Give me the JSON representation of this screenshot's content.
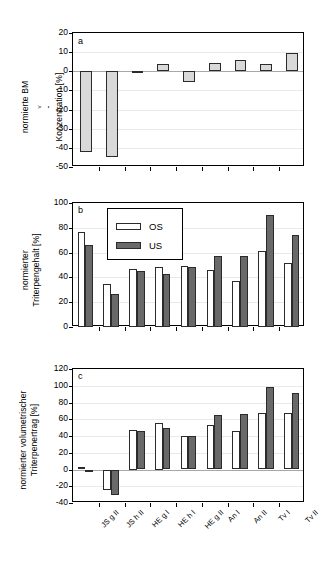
{
  "figure": {
    "categories": [
      "JS g II",
      "JS h II",
      "HE g I",
      "HE h I",
      "HE g II",
      "An I",
      "An II",
      "Tv I",
      "Tv II"
    ],
    "legend": {
      "os_label": "OS",
      "us_label": "US"
    },
    "colors": {
      "os": "#ffffff",
      "us": "#696969",
      "single": "#d9d9d9",
      "axis": "#000000",
      "grid": "#e9e9e9",
      "zero": "#a8a8a8"
    }
  },
  "chart_data": [
    {
      "type": "bar",
      "panel": "a",
      "panel_label": "a",
      "title": "",
      "xlabel": "",
      "ylabel": "normierte BMv-Konzentration [%]",
      "ylabel_line1": "normierte BM",
      "ylabel_sub": "v",
      "ylabel_line1_tail": "-",
      "ylabel_line2": "Konzentration [%]",
      "categories": [
        "JS g II",
        "JS h II",
        "HE g I",
        "HE h I",
        "HE g II",
        "An I",
        "An II",
        "Tv I",
        "Tv II"
      ],
      "values": [
        -42,
        -45,
        -0.3,
        4,
        -5.5,
        4.5,
        6,
        4,
        9.5
      ],
      "ylim": [
        -50,
        20
      ],
      "yticks": [
        20,
        10,
        0,
        -10,
        -20,
        -30,
        -40,
        -50
      ],
      "grid": true,
      "legend_position": "none"
    },
    {
      "type": "bar",
      "panel": "b",
      "panel_label": "b",
      "title": "",
      "xlabel": "",
      "ylabel": "normierter Triterpengehalt [%]",
      "ylabel_line1": "normierter",
      "ylabel_line2": "Triterpengehalt [%]",
      "categories": [
        "JS g II",
        "JS h II",
        "HE g I",
        "HE h I",
        "HE g II",
        "An I",
        "An II",
        "Tv I",
        "Tv II"
      ],
      "series": [
        {
          "name": "OS",
          "values": [
            77,
            35,
            47,
            48,
            49,
            46,
            37.5,
            61.5,
            51.5
          ]
        },
        {
          "name": "US",
          "values": [
            66.5,
            27,
            45,
            43,
            48.5,
            57,
            57,
            90.5,
            74
          ]
        }
      ],
      "ylim": [
        0,
        100
      ],
      "yticks": [
        100,
        80,
        60,
        40,
        20,
        0
      ],
      "grid": true,
      "legend_position": "top-left"
    },
    {
      "type": "bar",
      "panel": "c",
      "panel_label": "c",
      "title": "",
      "xlabel": "",
      "ylabel": "normierter volumetrischer Triterpenertrag [%]",
      "ylabel_line1": "normierter volumetrischer",
      "ylabel_line2": "Triterpenertrag [%]",
      "categories": [
        "JS g II",
        "JS h II",
        "HE g I",
        "HE h I",
        "HE g II",
        "An I",
        "An II",
        "Tv I",
        "Tv II"
      ],
      "series": [
        {
          "name": "OS",
          "values": [
            3,
            -25,
            47.5,
            55,
            40.5,
            53.5,
            46.5,
            68,
            67
          ]
        },
        {
          "name": "US",
          "values": [
            -2,
            -30,
            45.5,
            49.5,
            40.5,
            64.5,
            66.5,
            98,
            91
          ]
        }
      ],
      "ylim": [
        -40,
        120
      ],
      "yticks": [
        120,
        100,
        80,
        60,
        40,
        20,
        0,
        -20,
        -40
      ],
      "grid": true,
      "legend_position": "none"
    }
  ]
}
